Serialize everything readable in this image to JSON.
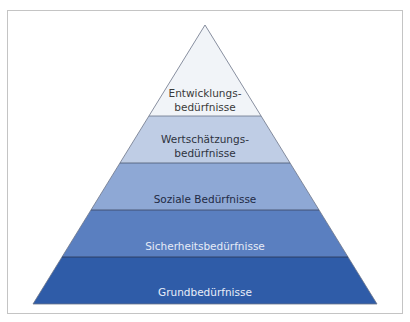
{
  "diagram": {
    "type": "pyramid",
    "levels": [
      {
        "label_lines": [
          "Entwicklungs-",
          "bedürfnisse"
        ],
        "fill": "#f1f4f8",
        "text_color": "#3a3a3a"
      },
      {
        "label_lines": [
          "Wertschätzungs-",
          "bedürfnisse"
        ],
        "fill": "#bfcde5",
        "text_color": "#2e3340"
      },
      {
        "label_lines": [
          "Soziale Bedürfnisse"
        ],
        "fill": "#8ea8d5",
        "text_color": "#1f2a44"
      },
      {
        "label_lines": [
          "Sicherheitsbedürfnisse"
        ],
        "fill": "#5a7fc0",
        "text_color": "#e6ecf7"
      },
      {
        "label_lines": [
          "Grundbedürfnisse"
        ],
        "fill": "#2f5ca8",
        "text_color": "#e8eef8"
      }
    ],
    "border_color": "#c4c4c4",
    "divider_color": "#4a5670"
  }
}
